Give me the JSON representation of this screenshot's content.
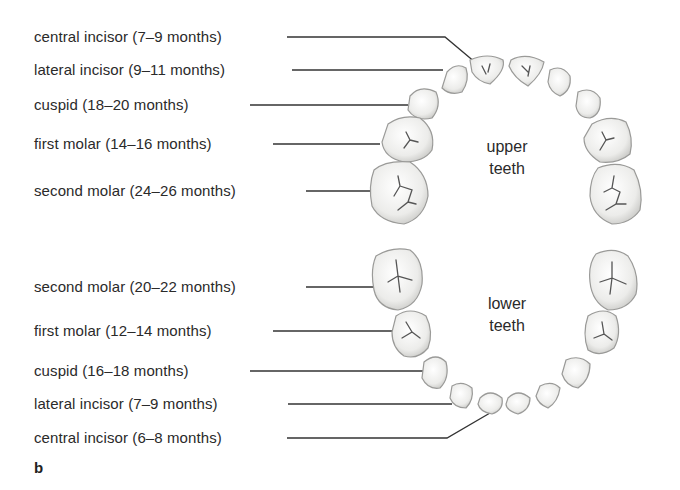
{
  "panel_letter": "b",
  "upper": {
    "title_line1": "upper",
    "title_line2": "teeth",
    "labels": [
      {
        "text": "central incisor (7–9 months)"
      },
      {
        "text": "lateral incisor (9–11 months)"
      },
      {
        "text": "cuspid (18–20 months)"
      },
      {
        "text": "first molar (14–16 months)"
      },
      {
        "text": "second molar (24–26 months)"
      }
    ]
  },
  "lower": {
    "title_line1": "lower",
    "title_line2": "teeth",
    "labels": [
      {
        "text": "second molar (20–22 months)"
      },
      {
        "text": "first molar (12–14 months)"
      },
      {
        "text": "cuspid (16–18 months)"
      },
      {
        "text": "lateral incisor (7–9 months)"
      },
      {
        "text": "central incisor (6–8 months)"
      }
    ]
  },
  "colors": {
    "line": "#333333",
    "tooth_fill": "#f4f4f2",
    "tooth_stroke": "#9a9a98",
    "groove": "#555555"
  }
}
